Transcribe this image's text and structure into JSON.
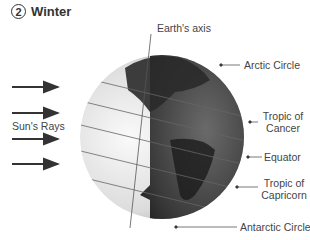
{
  "title": {
    "number": "2",
    "text": "Winter"
  },
  "labels": {
    "axis": "Earth's axis",
    "arctic": "Arctic Circle",
    "cancer_1": "Tropic of",
    "cancer_2": "Cancer",
    "equator": "Equator",
    "capricorn_1": "Tropic of",
    "capricorn_2": "Capricorn",
    "antarctic": "Antarctic Circle",
    "sun": "Sun's Rays"
  },
  "colors": {
    "day": "#f2f2f2",
    "night": "#2e2e2e",
    "arrow": "#333333",
    "line": "#555555"
  }
}
